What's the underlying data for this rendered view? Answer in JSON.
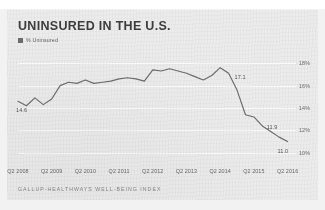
{
  "top_strip": {
    "ghost_text": "cut-off line of text above the chart"
  },
  "header": {
    "title": "UNINSURED IN THE U.S."
  },
  "legend": {
    "marker_color": "#6e6e72",
    "label": "% Uninsured"
  },
  "footer": {
    "source": "GALLUP-HEALTHWAYS WELL-BEING INDEX"
  },
  "colors": {
    "card_background": "#ececed",
    "page_background": "#f2f2f2",
    "line": "#6b6b70",
    "gridline": "#ffffff",
    "title_text": "#3d3d3f",
    "axis_text": "#68686b",
    "annotation_text": "#55555a",
    "source_text": "#86868a"
  },
  "chart_data": {
    "type": "line",
    "title": "UNINSURED IN THE U.S.",
    "subtitle": "",
    "xlabel": "",
    "ylabel": "",
    "ylim": [
      9,
      19
    ],
    "xlim": [
      0,
      33
    ],
    "grid": true,
    "legend_position": "top-left",
    "ytick_labels": [
      "18%",
      "16%",
      "14%",
      "12%",
      "10%"
    ],
    "ytick_values": [
      18,
      16,
      14,
      12,
      10
    ],
    "xtick_labels": [
      "Q2 2008",
      "Q2 2009",
      "Q2 2010",
      "Q2 2011",
      "Q2 2012",
      "Q2 2013",
      "Q2 2014",
      "Q2 2015",
      "Q2 2016"
    ],
    "xtick_indices": [
      0,
      4,
      8,
      12,
      16,
      20,
      24,
      28,
      32
    ],
    "series": [
      {
        "name": "% Uninsured",
        "color": "#6b6b70",
        "x": [
          0,
          1,
          2,
          3,
          4,
          5,
          6,
          7,
          8,
          9,
          10,
          11,
          12,
          13,
          14,
          15,
          16,
          17,
          18,
          19,
          20,
          21,
          22,
          23,
          24,
          25,
          26,
          27,
          28,
          29,
          30,
          31,
          32
        ],
        "values": [
          14.6,
          14.2,
          14.9,
          14.3,
          14.8,
          16.0,
          16.3,
          16.2,
          16.5,
          16.2,
          16.3,
          16.4,
          16.6,
          16.7,
          16.6,
          16.4,
          17.4,
          17.3,
          17.5,
          17.3,
          17.1,
          16.8,
          16.5,
          16.9,
          17.6,
          17.1,
          15.6,
          13.4,
          13.2,
          12.4,
          11.9,
          11.4,
          11.0
        ]
      }
    ],
    "annotations": [
      {
        "label": "14.6",
        "x_index": 0,
        "value": 14.6,
        "position": "below-left"
      },
      {
        "label": "17.1",
        "x_index": 25,
        "value": 17.1,
        "position": "right"
      },
      {
        "label": "11.9",
        "x_index": 30,
        "value": 11.9,
        "position": "above"
      },
      {
        "label": "11.0",
        "x_index": 32,
        "value": 11.0,
        "position": "below-right"
      }
    ]
  }
}
